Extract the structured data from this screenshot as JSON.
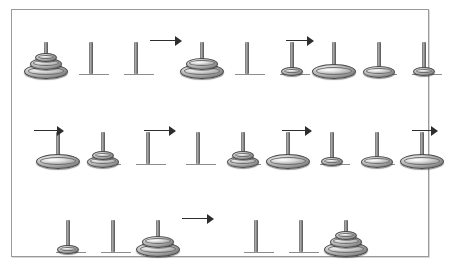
{
  "figure": {
    "border_color": "#9a9a9a",
    "background": "#ffffff",
    "disk_color": "#9d9d9d",
    "rod_color": "#8c8c8c",
    "arrow_color": "#2e2e2e",
    "frame": {
      "x": 11,
      "y": 9,
      "width": 418,
      "height": 248
    }
  },
  "puzzle": {
    "num_pegs": 3,
    "num_disks": 3,
    "disk_sizes": [
      "small",
      "medium",
      "large"
    ],
    "total_states": 8,
    "total_moves": 7
  },
  "rows": [
    {
      "index": 0,
      "y": 22,
      "states": [
        {
          "id": "s0",
          "x": 30,
          "label": "start",
          "pegs": [
            [
              "large",
              "medium",
              "small"
            ],
            [],
            []
          ]
        },
        {
          "id": "s1",
          "x": 186,
          "label": "move 1",
          "pegs": [
            [
              "large",
              "medium"
            ],
            [],
            [
              "small"
            ]
          ]
        },
        {
          "id": "s2",
          "x": 318,
          "label": "move 2",
          "pegs": [
            [
              "large"
            ],
            [
              "medium"
            ],
            [
              "small"
            ]
          ]
        }
      ],
      "arrows": [
        {
          "x": 150,
          "y": 36,
          "width": 32
        },
        {
          "x": 286,
          "y": 36,
          "width": 28
        }
      ]
    },
    {
      "index": 1,
      "y": 112,
      "states": [
        {
          "id": "s3",
          "x": 42,
          "label": "move 3",
          "pegs": [
            [
              "large"
            ],
            [
              "medium",
              "small"
            ],
            []
          ]
        },
        {
          "id": "s4",
          "x": 182,
          "label": "move 4",
          "pegs": [
            [],
            [
              "medium",
              "small"
            ],
            [
              "large"
            ]
          ]
        },
        {
          "id": "s5",
          "x": 316,
          "label": "move 5",
          "pegs": [
            [
              "small"
            ],
            [
              "medium"
            ],
            [
              "large"
            ]
          ]
        }
      ],
      "arrows": [
        {
          "x": 34,
          "y": 126,
          "width": 30
        },
        {
          "x": 144,
          "y": 126,
          "width": 32
        },
        {
          "x": 282,
          "y": 126,
          "width": 30
        },
        {
          "x": 412,
          "y": 126,
          "width": 26
        }
      ]
    },
    {
      "index": 2,
      "y": 200,
      "states": [
        {
          "id": "s6",
          "x": 52,
          "label": "move 6",
          "pegs": [
            [
              "small"
            ],
            [],
            [
              "large",
              "medium"
            ]
          ]
        },
        {
          "id": "s7",
          "x": 240,
          "label": "final",
          "pegs": [
            [],
            [],
            [
              "large",
              "medium",
              "small"
            ]
          ]
        }
      ],
      "arrows": [
        {
          "x": 182,
          "y": 214,
          "width": 32
        }
      ]
    }
  ],
  "geometry": {
    "peg_spacing": 45,
    "rod_height": 32,
    "rod_width": 4,
    "ground_width": 30,
    "disk_dims": {
      "small": {
        "w": 22,
        "h": 9
      },
      "medium": {
        "w": 32,
        "h": 12
      },
      "large": {
        "w": 44,
        "h": 15
      }
    }
  }
}
